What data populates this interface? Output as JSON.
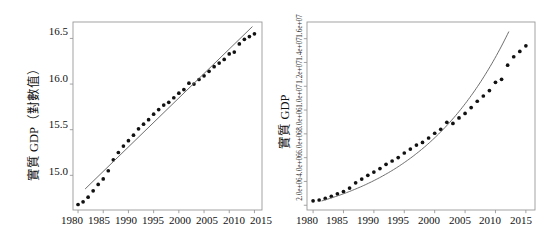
{
  "figure": {
    "type": "two-panel-scatter-with-trend",
    "background": "#ffffff",
    "point_color": "#111111",
    "line_color": "#666666",
    "frame_color": "#999999"
  },
  "panels": [
    {
      "id": "left",
      "ylabel": "實質 GDP（對數值）",
      "xlabel": "",
      "ytick_labels": [
        "15.0",
        "15.5",
        "16.0",
        "16.5"
      ],
      "xtick_labels": [
        "1980",
        "1985",
        "1990",
        "1995",
        "2000",
        "2005",
        "2010",
        "2015"
      ]
    },
    {
      "id": "right",
      "ylabel": "實質 GDP",
      "xlabel": "",
      "ytick_labels": [
        "2.0e+06",
        "4.0e+06",
        "6.0e+06",
        "8.0e+06",
        "1.0e+07",
        "1.2e+07",
        "1.4e+07",
        "1.6e+07"
      ],
      "xtick_labels": [
        "1980",
        "1985",
        "1990",
        "1995",
        "2000",
        "2005",
        "2010",
        "2015"
      ]
    }
  ],
  "chart_data": [
    {
      "type": "scatter",
      "panel": "left",
      "title": "",
      "xlabel": "",
      "ylabel": "實質 GDP（對數值）",
      "xlim": [
        1979.0,
        2016.5
      ],
      "ylim": [
        14.62,
        16.68
      ],
      "xticks": [
        1980,
        1985,
        1990,
        1995,
        2000,
        2005,
        2010,
        2015
      ],
      "yticks": [
        15.0,
        15.5,
        16.0,
        16.5
      ],
      "grid": false,
      "legend": "none",
      "x": [
        1980,
        1981,
        1982,
        1983,
        1984,
        1985,
        1986,
        1987,
        1988,
        1989,
        1990,
        1991,
        1992,
        1993,
        1994,
        1995,
        1996,
        1997,
        1998,
        1999,
        2000,
        2001,
        2002,
        2003,
        2004,
        2005,
        2006,
        2007,
        2008,
        2009,
        2010,
        2011,
        2012,
        2013,
        2014,
        2015
      ],
      "series": [
        {
          "name": "實質 GDP（對數值）",
          "type": "points",
          "values": [
            14.68,
            14.71,
            14.76,
            14.83,
            14.9,
            14.96,
            15.05,
            15.17,
            15.25,
            15.32,
            15.38,
            15.44,
            15.51,
            15.56,
            15.61,
            15.67,
            15.72,
            15.77,
            15.8,
            15.85,
            15.9,
            15.94,
            16.01,
            16.0,
            16.05,
            16.09,
            16.14,
            16.19,
            16.23,
            16.27,
            16.33,
            16.35,
            16.44,
            16.49,
            16.52,
            16.55
          ]
        },
        {
          "name": "線性趨勢線",
          "type": "line",
          "x_range": [
            1981.4,
            2014.6
          ],
          "y_range": [
            14.85,
            16.63
          ]
        }
      ]
    },
    {
      "type": "scatter",
      "panel": "right",
      "title": "",
      "xlabel": "",
      "ylabel": "實質 GDP",
      "xlim": [
        1979.0,
        2016.5
      ],
      "ylim": [
        1600000,
        17400000
      ],
      "xticks": [
        1980,
        1985,
        1990,
        1995,
        2000,
        2005,
        2010,
        2015
      ],
      "yticks": [
        2000000,
        4000000,
        6000000,
        8000000,
        10000000,
        12000000,
        14000000,
        16000000
      ],
      "ytick_text": [
        "2.0e+06",
        "4.0e+06",
        "6.0e+06",
        "8.0e+06",
        "1.0e+07",
        "1.2e+07",
        "1.4e+07",
        "1.6e+07"
      ],
      "grid": false,
      "legend": "none",
      "x": [
        1980,
        1981,
        1982,
        1983,
        1984,
        1985,
        1986,
        1987,
        1988,
        1989,
        1990,
        1991,
        1992,
        1993,
        1994,
        1995,
        1996,
        1997,
        1998,
        1999,
        2000,
        2001,
        2002,
        2003,
        2004,
        2005,
        2006,
        2007,
        2008,
        2009,
        2010,
        2011,
        2012,
        2013,
        2014,
        2015
      ],
      "series": [
        {
          "name": "實質 GDP",
          "type": "points",
          "values": [
            2370000,
            2440000,
            2570000,
            2750000,
            2960000,
            3150000,
            3440000,
            3880000,
            4200000,
            4510000,
            4790000,
            5080000,
            5440000,
            5720000,
            6010000,
            6390000,
            6720000,
            7060000,
            7280000,
            7650000,
            8050000,
            8380000,
            8970000,
            8880000,
            9340000,
            9720000,
            10210000,
            10740000,
            11180000,
            11640000,
            12330000,
            12580000,
            13770000,
            14480000,
            14930000,
            15400000
          ]
        },
        {
          "name": "指數趨勢線",
          "type": "line",
          "x_range": [
            1981.4,
            2012.2
          ],
          "y_range": [
            2360000,
            16600000
          ]
        }
      ]
    }
  ]
}
